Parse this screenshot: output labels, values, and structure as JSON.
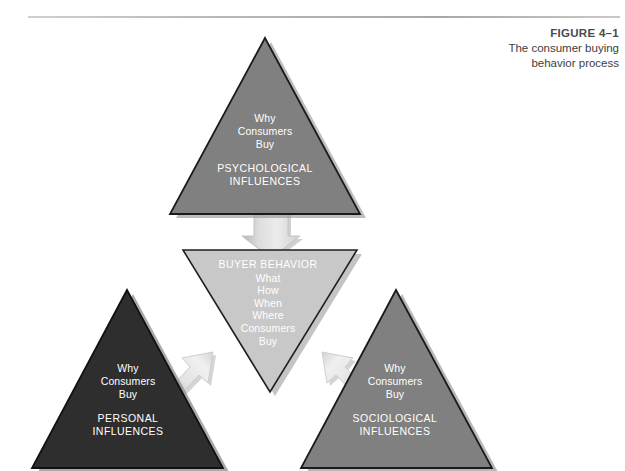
{
  "figure": {
    "label": "FIGURE 4–1",
    "title_line_1": "The consumer buying",
    "title_line_2": "behavior process"
  },
  "colors": {
    "background": "#ffffff",
    "rule": "#b9b9b9",
    "triangle_medium_gray": "#808080",
    "triangle_dark_gray": "#2e2e2e",
    "triangle_light_gray": "#c8c8c8",
    "triangle_outline": "#1a1a1a",
    "arrow_fill": "#d9d9d9",
    "arrow_outline": "#cdcdcd",
    "shadow": "#9a9a9a",
    "text_on_triangle": "#ffffff",
    "caption_text": "#3d3d3d"
  },
  "diagram": {
    "type": "process-diagram",
    "nodes": [
      {
        "id": "psychological",
        "position": "top",
        "shape": "triangle-up",
        "fill": "#808080",
        "question_lines": [
          "Why",
          "Consumers",
          "Buy"
        ],
        "influence_lines": [
          "PSYCHOLOGICAL",
          "INFLUENCES"
        ]
      },
      {
        "id": "personal",
        "position": "bottom-left",
        "shape": "triangle-up",
        "fill": "#2e2e2e",
        "question_lines": [
          "Why",
          "Consumers",
          "Buy"
        ],
        "influence_lines": [
          "PERSONAL",
          "INFLUENCES"
        ]
      },
      {
        "id": "sociological",
        "position": "bottom-right",
        "shape": "triangle-up",
        "fill": "#808080",
        "question_lines": [
          "Why",
          "Consumers",
          "Buy"
        ],
        "influence_lines": [
          "SOCIOLOGICAL",
          "INFLUENCES"
        ]
      },
      {
        "id": "buyer-behavior",
        "position": "center",
        "shape": "triangle-down",
        "fill": "#c8c8c8",
        "heading": "BUYER BEHAVIOR",
        "detail_lines": [
          "What",
          "How",
          "When",
          "Where",
          "Consumers",
          "Buy"
        ]
      }
    ],
    "arrows": [
      {
        "id": "arrow-top-to-center",
        "from": "psychological",
        "to": "buyer-behavior",
        "direction": "down"
      },
      {
        "id": "arrow-left-to-center",
        "from": "personal",
        "to": "buyer-behavior",
        "direction": "up-right"
      },
      {
        "id": "arrow-right-to-center",
        "from": "sociological",
        "to": "buyer-behavior",
        "direction": "up-left"
      }
    ]
  }
}
